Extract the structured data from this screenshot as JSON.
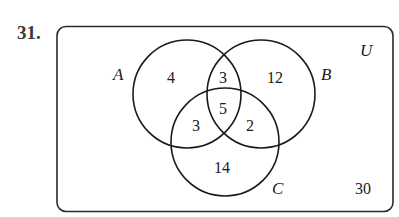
{
  "problem": {
    "number": "31."
  },
  "diagram": {
    "universe_label": "U",
    "sets": [
      {
        "name": "A",
        "label": "A"
      },
      {
        "name": "B",
        "label": "B"
      },
      {
        "name": "C",
        "label": "C"
      }
    ],
    "regions": {
      "A_only": "4",
      "A_and_B_only": "3",
      "B_only": "12",
      "A_and_B_and_C": "5",
      "A_and_C_only": "3",
      "B_and_C_only": "2",
      "C_only": "14",
      "outside": "30"
    },
    "colors": {
      "stroke": "#1a1a1a",
      "background": "#ffffff"
    }
  }
}
